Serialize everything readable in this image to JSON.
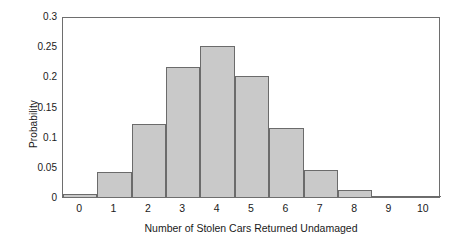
{
  "chart_data": {
    "type": "bar",
    "title": "",
    "subtitle": "",
    "xlabel": "Number of Stolen Cars Returned Undamaged",
    "ylabel": "Probability",
    "categories": [
      "0",
      "1",
      "2",
      "3",
      "4",
      "5",
      "6",
      "7",
      "8",
      "9",
      "10"
    ],
    "values": [
      0.005,
      0.041,
      0.121,
      0.215,
      0.251,
      0.201,
      0.114,
      0.045,
      0.012,
      0.002,
      0.0
    ],
    "xlim": [
      -0.5,
      10.5
    ],
    "ylim": [
      0,
      0.3
    ],
    "yticks": [
      "0",
      "0.05",
      "0.1",
      "0.15",
      "0.2",
      "0.25",
      "0.3"
    ],
    "ytick_values": [
      0,
      0.05,
      0.1,
      0.15,
      0.2,
      0.25,
      0.3
    ],
    "xticks": [
      "0",
      "1",
      "2",
      "3",
      "4",
      "5",
      "6",
      "7",
      "8",
      "9",
      "10"
    ],
    "grid": false,
    "legend": null,
    "legend_position": "none",
    "bar_fill_color": "#c9c9c9",
    "bar_edge_color": "#6b6b6b",
    "frame_color": "#6e6e6e",
    "text_color": "#1a1a1a",
    "background_color": "#ffffff",
    "annotations": []
  }
}
